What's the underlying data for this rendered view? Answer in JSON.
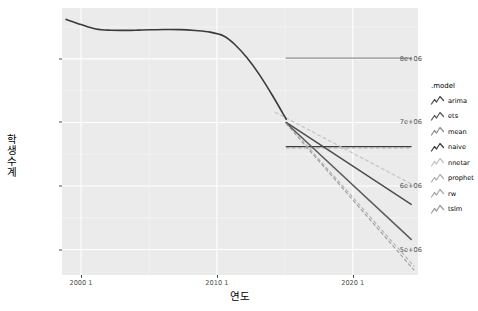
{
  "chart_data": {
    "type": "line",
    "title": "",
    "xlabel": "연도",
    "ylabel": "학생수계",
    "xlim": [
      1998.7,
      2024.9
    ],
    "ylim": [
      4600000,
      8800000
    ],
    "xticks": [
      {
        "value": 2000.1,
        "label": "2000 1"
      },
      {
        "value": 2010.1,
        "label": "2010 1"
      },
      {
        "value": 2020.1,
        "label": "2020 1"
      }
    ],
    "yticks": [
      {
        "value": 8000000,
        "label": "8e+06"
      },
      {
        "value": 7000000,
        "label": "7e+06"
      },
      {
        "value": 6000000,
        "label": "6e+06"
      },
      {
        "value": 5000000,
        "label": "5e+06"
      }
    ],
    "grid": true,
    "legend": {
      "title": ".model",
      "position": "right",
      "entries": [
        {
          "name": "arima",
          "color": "#4d4d4d",
          "dash": "none"
        },
        {
          "name": "ets",
          "color": "#5c5c5c",
          "dash": "none"
        },
        {
          "name": "mean",
          "color": "#8f8f8f",
          "dash": "none"
        },
        {
          "name": "naive",
          "color": "#3d3d3d",
          "dash": "none"
        },
        {
          "name": "nnetar",
          "color": "#c2c2c2",
          "dash": "none"
        },
        {
          "name": "prophet",
          "color": "#b0b0b0",
          "dash": "none"
        },
        {
          "name": "rw",
          "color": "#a8a8a8",
          "dash": "none"
        },
        {
          "name": "tslm",
          "color": "#9c9c9c",
          "dash": "none"
        }
      ]
    },
    "history": {
      "name": "observed",
      "color": "#3a3a3a",
      "x": [
        1999.0,
        2000.1,
        2001.2,
        2002.3,
        2003.4,
        2004.3,
        2005.2,
        2006.3,
        2007.4,
        2008.5,
        2009.6,
        2010.6,
        2011.4,
        2012.3,
        2013.2,
        2014.2,
        2015.2
      ],
      "y": [
        8620000,
        8540000,
        8470000,
        8450000,
        8448000,
        8452000,
        8458000,
        8462000,
        8460000,
        8445000,
        8420000,
        8360000,
        8230000,
        8020000,
        7760000,
        7420000,
        7050000
      ]
    },
    "forecast_origin": {
      "x": 2015.2,
      "y": 7050000
    },
    "forecasts": [
      {
        "name": "mean",
        "color": "#8f8f8f",
        "dash": "none",
        "width": 1.3,
        "x": [
          2015.2,
          2024.4
        ],
        "y": [
          8010000,
          8010000
        ]
      },
      {
        "name": "naive",
        "color": "#3d3d3d",
        "dash": "none",
        "width": 1.1,
        "x": [
          2015.2,
          2024.4
        ],
        "y": [
          6620000,
          6620000
        ]
      },
      {
        "name": "rw",
        "color": "#a8a8a8",
        "dash": "3 3",
        "width": 1.1,
        "x": [
          2015.2,
          2024.4
        ],
        "y": [
          6600000,
          6600000
        ]
      },
      {
        "name": "nnetar",
        "color": "#c2c2c2",
        "dash": "3 3",
        "width": 1.1,
        "x": [
          2014.4,
          2024.6
        ],
        "y": [
          7160000,
          6010000
        ]
      },
      {
        "name": "prophet",
        "color": "#b0b0b0",
        "dash": "3 3",
        "width": 1.1,
        "x": [
          2015.2,
          2024.6
        ],
        "y": [
          7000000,
          4740000
        ]
      },
      {
        "name": "arima",
        "color": "#4d4d4d",
        "dash": "none",
        "width": 1.5,
        "x": [
          2015.2,
          2024.4
        ],
        "y": [
          7000000,
          5710000
        ]
      },
      {
        "name": "ets",
        "color": "#5c5c5c",
        "dash": "none",
        "width": 1.5,
        "x": [
          2015.2,
          2024.4
        ],
        "y": [
          6990000,
          5160000
        ]
      },
      {
        "name": "tslm",
        "color": "#9c9c9c",
        "dash": "3 3",
        "width": 1.1,
        "x": [
          2015.2,
          2024.6
        ],
        "y": [
          6980000,
          4680000
        ]
      }
    ]
  }
}
